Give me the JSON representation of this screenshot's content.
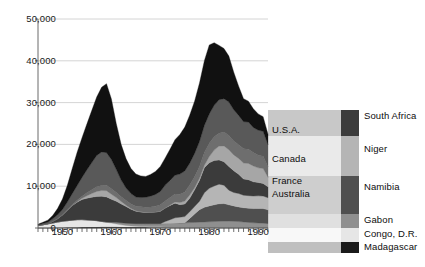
{
  "chart_data": {
    "type": "area",
    "stacked": true,
    "title": "",
    "subtitle": "",
    "xlabel": "",
    "ylabel": "",
    "xlim": [
      1945,
      1992
    ],
    "ylim": [
      0,
      50000
    ],
    "grid": true,
    "grid_axis": "y",
    "legend_position": "right",
    "y_ticks": [
      0,
      10000,
      20000,
      30000,
      40000,
      50000
    ],
    "y_tick_labels": [
      "0",
      "10,000",
      "20,000",
      "30,000",
      "40,000",
      "50,000"
    ],
    "x_ticks": [
      1950,
      1960,
      1970,
      1980,
      1990
    ],
    "x_tick_labels": [
      "1950",
      "1960",
      "1970",
      "1980",
      "1990"
    ],
    "x_minor_tick_interval": 1,
    "inline_labels": [
      {
        "text": "U.S.A.",
        "series": "U.S.A."
      },
      {
        "text": "Canada",
        "series": "Canada"
      },
      {
        "text": "France",
        "series": "France"
      },
      {
        "text": "Australia",
        "series": "Australia"
      }
    ],
    "legend_entries": [
      {
        "label": "South Africa",
        "color": "#3b3b3b"
      },
      {
        "label": "Niger",
        "color": "#b5b5b5"
      },
      {
        "label": "Namibia",
        "color": "#4f4f4f"
      },
      {
        "label": "Gabon",
        "color": "#8f8f8f"
      },
      {
        "label": "Congo, D.R.",
        "color": "#e6e6e6"
      },
      {
        "label": "Madagascar",
        "color": "#1a1a1a"
      }
    ],
    "x": [
      1945,
      1946,
      1947,
      1948,
      1949,
      1950,
      1951,
      1952,
      1953,
      1954,
      1955,
      1956,
      1957,
      1958,
      1959,
      1960,
      1961,
      1962,
      1963,
      1964,
      1965,
      1966,
      1967,
      1968,
      1969,
      1970,
      1971,
      1972,
      1973,
      1974,
      1975,
      1976,
      1977,
      1978,
      1979,
      1980,
      1981,
      1982,
      1983,
      1984,
      1985,
      1986,
      1987,
      1988,
      1989,
      1990,
      1991,
      1992
    ],
    "series": [
      {
        "name": "Madagascar",
        "color": "#1a1a1a",
        "values": [
          60,
          70,
          80,
          90,
          110,
          130,
          150,
          170,
          190,
          210,
          230,
          250,
          260,
          270,
          280,
          280,
          270,
          260,
          250,
          240,
          230,
          220,
          210,
          200,
          195,
          190,
          185,
          180,
          180,
          180,
          180,
          180,
          180,
          180,
          180,
          180,
          180,
          180,
          180,
          180,
          180,
          180,
          180,
          180,
          180,
          180,
          180,
          180
        ]
      },
      {
        "name": "Congo, D.R.",
        "color": "#e6e6e6",
        "values": [
          500,
          700,
          900,
          1100,
          1300,
          1500,
          1600,
          1700,
          1800,
          1800,
          1700,
          1600,
          1500,
          1300,
          1100,
          900,
          700,
          500,
          350,
          250,
          180,
          150,
          120,
          100,
          90,
          80,
          70,
          60,
          60,
          60,
          60,
          60,
          60,
          60,
          60,
          60,
          60,
          60,
          60,
          60,
          60,
          60,
          60,
          60,
          60,
          60,
          60,
          60
        ]
      },
      {
        "name": "Gabon",
        "color": "#8f8f8f",
        "values": [
          0,
          0,
          0,
          0,
          0,
          0,
          0,
          0,
          0,
          0,
          0,
          0,
          0,
          0,
          50,
          200,
          400,
          500,
          550,
          600,
          620,
          650,
          680,
          700,
          720,
          750,
          800,
          850,
          900,
          950,
          1000,
          1050,
          1100,
          1150,
          1200,
          1250,
          1300,
          1350,
          1400,
          1400,
          1350,
          1300,
          1200,
          1100,
          1000,
          950,
          900,
          800
        ]
      },
      {
        "name": "Namibia",
        "color": "#4f4f4f",
        "values": [
          0,
          0,
          0,
          0,
          0,
          0,
          0,
          0,
          0,
          0,
          0,
          0,
          0,
          0,
          0,
          0,
          0,
          0,
          0,
          0,
          0,
          0,
          0,
          0,
          0,
          0,
          0,
          0,
          0,
          0,
          0,
          1000,
          2000,
          3000,
          3500,
          3800,
          4000,
          4200,
          4200,
          3900,
          3700,
          3500,
          3400,
          3400,
          3400,
          3500,
          3500,
          3300
        ]
      },
      {
        "name": "Niger",
        "color": "#b5b5b5",
        "values": [
          0,
          0,
          0,
          0,
          0,
          0,
          0,
          0,
          0,
          0,
          0,
          0,
          0,
          0,
          0,
          0,
          0,
          0,
          0,
          0,
          0,
          0,
          0,
          0,
          0,
          0,
          500,
          900,
          1300,
          1400,
          1500,
          1600,
          1800,
          2000,
          3500,
          4200,
          4500,
          4700,
          4400,
          3500,
          3200,
          3200,
          3000,
          3000,
          3000,
          3000,
          3000,
          2900
        ]
      },
      {
        "name": "South Africa",
        "color": "#3b3b3b",
        "values": [
          0,
          0,
          0,
          400,
          800,
          1500,
          2500,
          3500,
          4200,
          4800,
          5200,
          5500,
          5800,
          6000,
          6000,
          5500,
          5000,
          4500,
          4000,
          3400,
          3000,
          2800,
          2700,
          2700,
          2800,
          3000,
          3200,
          3400,
          3500,
          3000,
          3000,
          3200,
          4000,
          5000,
          6000,
          6100,
          6100,
          5800,
          5600,
          5700,
          5200,
          4600,
          3900,
          3800,
          3400,
          3200,
          3000,
          2600
        ]
      },
      {
        "name": "Australia",
        "color": "#a6a6a6",
        "values": [
          0,
          0,
          0,
          0,
          0,
          0,
          0,
          0,
          100,
          300,
          600,
          900,
          1200,
          1400,
          1500,
          1200,
          900,
          600,
          300,
          150,
          80,
          50,
          30,
          20,
          20,
          20,
          20,
          100,
          300,
          500,
          700,
          800,
          500,
          500,
          600,
          1500,
          2500,
          3300,
          3800,
          4000,
          3800,
          3800,
          3800,
          3900,
          3800,
          3500,
          3600,
          2300
        ]
      },
      {
        "name": "France",
        "color": "#6e6e6e",
        "values": [
          0,
          0,
          0,
          0,
          50,
          100,
          150,
          250,
          350,
          500,
          700,
          900,
          1100,
          1200,
          1300,
          1300,
          1200,
          1100,
          1100,
          1100,
          1100,
          1200,
          1200,
          1300,
          1400,
          1500,
          1700,
          1800,
          1900,
          2000,
          2200,
          2400,
          2600,
          2800,
          3000,
          3200,
          3200,
          3100,
          3300,
          3400,
          3300,
          3300,
          3400,
          3400,
          3200,
          3000,
          2900,
          2500
        ]
      },
      {
        "name": "Canada",
        "color": "#595959",
        "values": [
          200,
          300,
          400,
          600,
          900,
          1200,
          1800,
          2600,
          3500,
          4500,
          5500,
          6500,
          7500,
          8000,
          7800,
          7000,
          5500,
          4000,
          3000,
          2500,
          2200,
          2200,
          2400,
          2600,
          2800,
          3200,
          3800,
          4100,
          4500,
          4800,
          5000,
          5200,
          5600,
          6000,
          6500,
          7000,
          7500,
          8000,
          8000,
          8000,
          7500,
          7000,
          6500,
          6500,
          6000,
          6000,
          6000,
          5300
        ]
      },
      {
        "name": "U.S.A.",
        "color": "#111111",
        "values": [
          150,
          300,
          500,
          800,
          1500,
          2500,
          4000,
          6000,
          8000,
          9500,
          11000,
          12500,
          14000,
          15500,
          16500,
          14500,
          11000,
          8500,
          7000,
          6000,
          5500,
          5200,
          5000,
          5200,
          5500,
          6000,
          6500,
          7500,
          8500,
          9500,
          10500,
          11500,
          12500,
          14000,
          15500,
          16500,
          15000,
          13000,
          12000,
          11000,
          9000,
          7000,
          5500,
          5000,
          4500,
          3900,
          3500,
          2500
        ]
      }
    ]
  }
}
